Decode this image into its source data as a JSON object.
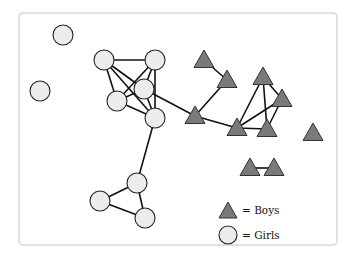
{
  "diagram": {
    "type": "social-network",
    "colors": {
      "girl_fill": "#ececec",
      "boy_fill": "#7a7a7a",
      "edge": "#111111",
      "frame": "#d9d9d9"
    },
    "nodes": [
      {
        "id": "G1",
        "group": "girl",
        "x": 63,
        "y": 35
      },
      {
        "id": "G2",
        "group": "girl",
        "x": 40,
        "y": 91
      },
      {
        "id": "G3",
        "group": "girl",
        "x": 104,
        "y": 60
      },
      {
        "id": "G4",
        "group": "girl",
        "x": 155,
        "y": 60
      },
      {
        "id": "G5",
        "group": "girl",
        "x": 144,
        "y": 89
      },
      {
        "id": "G6",
        "group": "girl",
        "x": 117,
        "y": 101
      },
      {
        "id": "G7",
        "group": "girl",
        "x": 155,
        "y": 118
      },
      {
        "id": "G8",
        "group": "girl",
        "x": 137,
        "y": 183
      },
      {
        "id": "G9",
        "group": "girl",
        "x": 100,
        "y": 201
      },
      {
        "id": "G10",
        "group": "girl",
        "x": 145,
        "y": 218
      },
      {
        "id": "B1",
        "group": "boy",
        "x": 204,
        "y": 60
      },
      {
        "id": "B2",
        "group": "boy",
        "x": 227,
        "y": 80
      },
      {
        "id": "B3",
        "group": "boy",
        "x": 195,
        "y": 116
      },
      {
        "id": "B4",
        "group": "boy",
        "x": 263,
        "y": 77
      },
      {
        "id": "B5",
        "group": "boy",
        "x": 282,
        "y": 99
      },
      {
        "id": "B6",
        "group": "boy",
        "x": 237,
        "y": 128
      },
      {
        "id": "B7",
        "group": "boy",
        "x": 267,
        "y": 129
      },
      {
        "id": "B8",
        "group": "boy",
        "x": 313,
        "y": 133
      },
      {
        "id": "B9",
        "group": "boy",
        "x": 250,
        "y": 168
      },
      {
        "id": "B10",
        "group": "boy",
        "x": 274,
        "y": 168
      }
    ],
    "edges": [
      [
        "G3",
        "G4"
      ],
      [
        "G3",
        "G6"
      ],
      [
        "G3",
        "G7"
      ],
      [
        "G3",
        "G5"
      ],
      [
        "G4",
        "G6"
      ],
      [
        "G4",
        "G5"
      ],
      [
        "G4",
        "G7"
      ],
      [
        "G5",
        "G6"
      ],
      [
        "G5",
        "G7"
      ],
      [
        "G6",
        "G7"
      ],
      [
        "G5",
        "B3"
      ],
      [
        "G7",
        "G8"
      ],
      [
        "G8",
        "G9"
      ],
      [
        "G8",
        "G10"
      ],
      [
        "G9",
        "G10"
      ],
      [
        "B1",
        "B2"
      ],
      [
        "B2",
        "B3"
      ],
      [
        "B3",
        "B6"
      ],
      [
        "B4",
        "B6"
      ],
      [
        "B4",
        "B7"
      ],
      [
        "B4",
        "B5"
      ],
      [
        "B5",
        "B6"
      ],
      [
        "B5",
        "B7"
      ],
      [
        "B6",
        "B7"
      ],
      [
        "B9",
        "B10"
      ]
    ]
  },
  "legend": {
    "items": [
      {
        "symbol": "triangle",
        "label": "= Boys"
      },
      {
        "symbol": "circle",
        "label": "= Girls"
      }
    ]
  }
}
